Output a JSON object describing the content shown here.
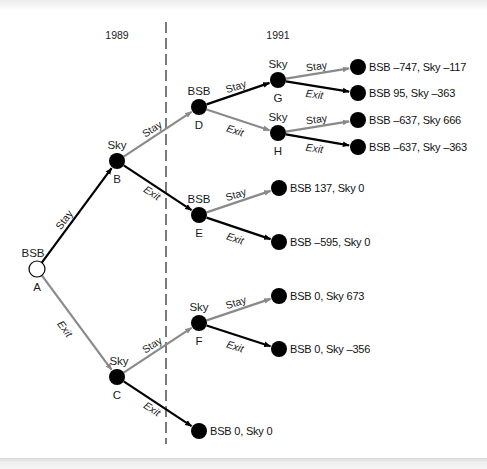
{
  "diagram": {
    "type": "game-tree",
    "years": [
      {
        "label": "1989",
        "x": 117,
        "y": 39
      },
      {
        "label": "1991",
        "x": 278,
        "y": 39
      }
    ],
    "divider": {
      "x": 166,
      "y1": 22,
      "y2": 444,
      "style": "dashed"
    },
    "colors": {
      "black_edge": "#000000",
      "gray_edge": "#8a8a8a",
      "node_fill": "#000000",
      "root_fill": "#ffffff"
    },
    "nodes": [
      {
        "id": "A",
        "player": "BSB",
        "x": 37,
        "y": 269,
        "open": true
      },
      {
        "id": "B",
        "player": "Sky",
        "x": 117,
        "y": 161
      },
      {
        "id": "C",
        "player": "Sky",
        "x": 117,
        "y": 377
      },
      {
        "id": "D",
        "player": "BSB",
        "x": 199,
        "y": 107
      },
      {
        "id": "E",
        "player": "BSB",
        "x": 199,
        "y": 215
      },
      {
        "id": "F",
        "player": "Sky",
        "x": 199,
        "y": 323
      },
      {
        "id": "G",
        "player": "Sky",
        "x": 278,
        "y": 80
      },
      {
        "id": "H",
        "player": "Sky",
        "x": 278,
        "y": 133
      }
    ],
    "terminals": [
      {
        "from": "G",
        "action": "Stay",
        "x": 358,
        "y": 67,
        "payoff": "BSB –747, Sky –117"
      },
      {
        "from": "G",
        "action": "Exit",
        "x": 358,
        "y": 93,
        "payoff": "BSB 95, Sky –363"
      },
      {
        "from": "H",
        "action": "Stay",
        "x": 358,
        "y": 120,
        "payoff": "BSB –637, Sky 666"
      },
      {
        "from": "H",
        "action": "Exit",
        "x": 358,
        "y": 147,
        "payoff": "BSB –637, Sky –363"
      },
      {
        "from": "E",
        "action": "Stay",
        "x": 279,
        "y": 188,
        "payoff": "BSB 137, Sky 0"
      },
      {
        "from": "E",
        "action": "Exit",
        "x": 279,
        "y": 242,
        "payoff": "BSB –595, Sky 0"
      },
      {
        "from": "F",
        "action": "Stay",
        "x": 279,
        "y": 296,
        "payoff": "BSB 0, Sky 673"
      },
      {
        "from": "F",
        "action": "Exit",
        "x": 279,
        "y": 349,
        "payoff": "BSB 0, Sky –356"
      },
      {
        "from": "C",
        "action": "Exit",
        "x": 199,
        "y": 431,
        "payoff": "BSB 0, Sky 0"
      }
    ],
    "edges": [
      {
        "from": "A",
        "to": "B",
        "label": "Stay",
        "color": "black"
      },
      {
        "from": "A",
        "to": "C",
        "label": "Exit",
        "color": "gray"
      },
      {
        "from": "B",
        "to": "D",
        "label": "Stay",
        "color": "gray"
      },
      {
        "from": "B",
        "to": "E",
        "label": "Exit",
        "color": "black"
      },
      {
        "from": "C",
        "to": "F",
        "label": "Stay",
        "color": "gray"
      },
      {
        "from": "C",
        "to": "T_C_Exit",
        "label": "Exit",
        "color": "black"
      },
      {
        "from": "D",
        "to": "G",
        "label": "Stay",
        "color": "black"
      },
      {
        "from": "D",
        "to": "H",
        "label": "Exit",
        "color": "gray"
      },
      {
        "from": "E",
        "to": "T_E_Stay",
        "label": "Stay",
        "color": "gray"
      },
      {
        "from": "E",
        "to": "T_E_Exit",
        "label": "Exit",
        "color": "black"
      },
      {
        "from": "F",
        "to": "T_F_Stay",
        "label": "Stay",
        "color": "gray"
      },
      {
        "from": "F",
        "to": "T_F_Exit",
        "label": "Exit",
        "color": "black"
      },
      {
        "from": "G",
        "to": "T_G_Stay",
        "label": "Stay",
        "color": "gray"
      },
      {
        "from": "G",
        "to": "T_G_Exit",
        "label": "Exit",
        "color": "black"
      },
      {
        "from": "H",
        "to": "T_H_Stay",
        "label": "Stay",
        "color": "gray"
      },
      {
        "from": "H",
        "to": "T_H_Exit",
        "label": "Exit",
        "color": "black"
      }
    ]
  }
}
